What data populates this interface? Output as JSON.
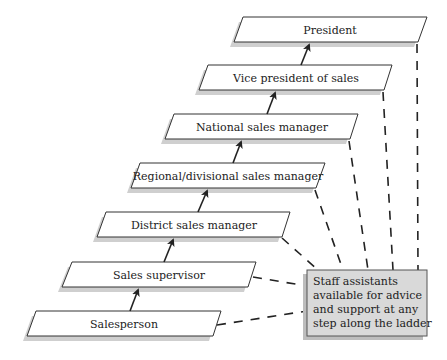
{
  "diagram": {
    "type": "career-ladder",
    "levels": [
      {
        "label": "Salesperson",
        "x": 36,
        "y": 311
      },
      {
        "label": "Sales supervisor",
        "x": 72,
        "y": 262
      },
      {
        "label": "District sales manager",
        "x": 106,
        "y": 212
      },
      {
        "label": "Regional/divisional sales manager",
        "x": 140,
        "y": 163
      },
      {
        "label": "National sales manager",
        "x": 174,
        "y": 114
      },
      {
        "label": "Vice president of sales",
        "x": 208,
        "y": 65
      },
      {
        "label": "President",
        "x": 243,
        "y": 17
      }
    ],
    "staff_box": {
      "lines": [
        "Staff assistants",
        "available for advice",
        "and support at any",
        "step along the ladder"
      ]
    },
    "colors": {
      "box_fill": "#ffffff",
      "box_stroke": "#333333",
      "shadow": "#cccccc",
      "staff_fill": "#d9d9d9",
      "line": "#222222"
    }
  }
}
